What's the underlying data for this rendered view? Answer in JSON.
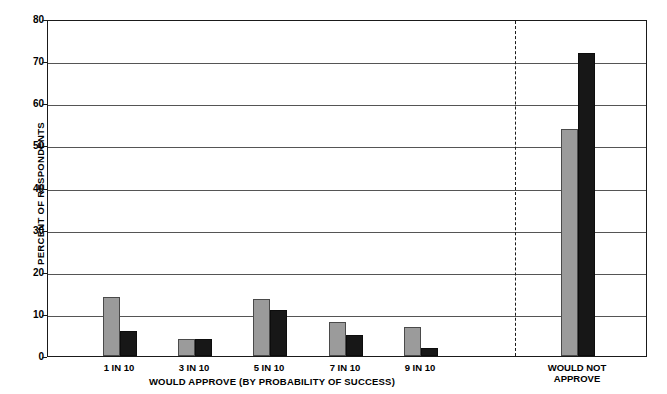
{
  "chart_data": {
    "type": "bar",
    "title": "",
    "subtitle": "",
    "xlabel": "WOULD APPROVE (BY PROBABILITY OF SUCCESS)",
    "ylabel": "PERCENT OF RESPONDENTS",
    "ylim": [
      0,
      80
    ],
    "ytick_labels": [
      "0",
      "10",
      "20",
      "30",
      "40",
      "50",
      "60",
      "70",
      "80"
    ],
    "ytick_values": [
      0,
      10,
      20,
      30,
      40,
      50,
      60,
      70,
      80
    ],
    "grid": "horizontal",
    "legend": "none",
    "legend_position": "none",
    "categories": [
      "1 IN 10",
      "3 IN 10",
      "5 IN 10",
      "7 IN 10",
      "9 IN 10",
      "WOULD NOT\nAPPROVE"
    ],
    "series": [
      {
        "name": "series-gray",
        "color": "#9b9b9b",
        "values": [
          14,
          4,
          13.5,
          8,
          7,
          54
        ]
      },
      {
        "name": "series-black",
        "color": "#171717",
        "values": [
          6,
          4,
          11,
          5,
          2,
          72
        ]
      }
    ],
    "annotations": [
      {
        "name": "group-divider",
        "type": "dashed-vertical-line",
        "after_category": "9 IN 10"
      }
    ],
    "group_label_right": "WOULD NOT\nAPPROVE"
  },
  "axis": {
    "y_title": "PERCENT OF RESPONDENTS",
    "x_title": "WOULD APPROVE (BY PROBABILITY OF SUCCESS)"
  },
  "colors": {
    "gray_bar": "#9b9b9b",
    "black_bar": "#171717",
    "axis": "#1a1a1a",
    "gridline": "#555555",
    "background": "#ffffff"
  }
}
